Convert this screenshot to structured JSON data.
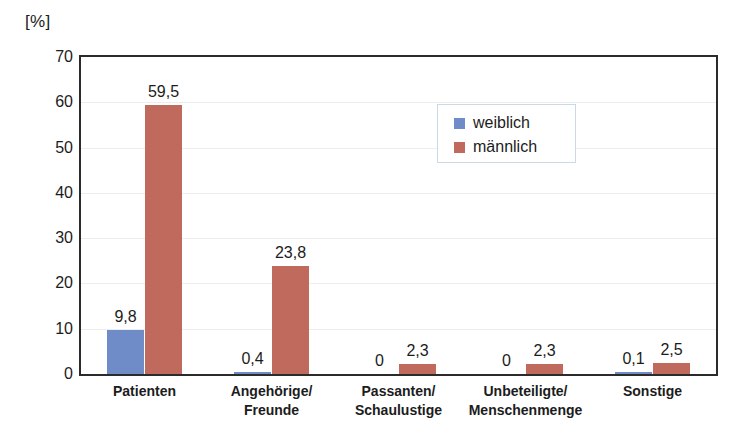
{
  "chart_data": {
    "type": "bar",
    "title": "",
    "subtitle": "",
    "xlabel": "",
    "ylabel": "[%]",
    "unit_caption": "[%]",
    "ylim": [
      0,
      70
    ],
    "ytick_step": 10,
    "yticks": [
      "70",
      "60",
      "50",
      "40",
      "30",
      "20",
      "10",
      "0"
    ],
    "ytick_values": [
      70,
      60,
      50,
      40,
      30,
      20,
      10,
      0
    ],
    "grid": true,
    "grid_axis": "y",
    "legend_position": "inside-top-right",
    "decimal_separator": ",",
    "categories": [
      "Patienten",
      "Angehörige/\nFreunde",
      "Passanten/\nSchaulustige",
      "Unbeteiligte/\nMenschenmenge",
      "Sonstige"
    ],
    "category_lines": [
      [
        "Patienten"
      ],
      [
        "Angehörige/",
        "Freunde"
      ],
      [
        "Passanten/",
        "Schaulustige"
      ],
      [
        "Unbeteiligte/",
        "Menschenmenge"
      ],
      [
        "Sonstige"
      ]
    ],
    "series": [
      {
        "name": "weiblich",
        "color": "#6f8cc8",
        "values": [
          9.8,
          0.4,
          0.0,
          0.0,
          0.1
        ],
        "labels": [
          "9,8",
          "0,4",
          "0",
          "0",
          "0,1"
        ]
      },
      {
        "name": "männlich",
        "color": "#c06a5e",
        "values": [
          59.5,
          23.8,
          2.3,
          2.3,
          2.5
        ],
        "labels": [
          "59,5",
          "23,8",
          "2,3",
          "2,3",
          "2,5"
        ]
      }
    ]
  },
  "legend": {
    "items": [
      {
        "label": "weiblich",
        "color": "#6f8cc8"
      },
      {
        "label": "männlich",
        "color": "#c06a5e"
      }
    ]
  },
  "colors": {
    "female": "#6f8cc8",
    "male": "#c06a5e",
    "axis": "#2b2b2b",
    "grid": "#ededed",
    "text": "#1c1c1c",
    "legend_border": "#c9d9e8",
    "background": "#ffffff"
  }
}
